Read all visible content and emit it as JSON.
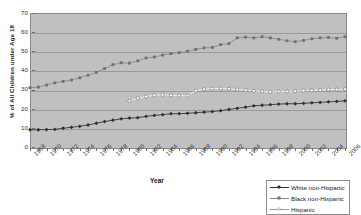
{
  "chart_data": {
    "type": "line",
    "title": "",
    "xlabel": "Year",
    "ylabel": "% of All Children under Age 18",
    "ylim": [
      0,
      70
    ],
    "ytick_values": [
      0,
      10,
      20,
      30,
      40,
      50,
      60,
      70
    ],
    "ytick_labels": [
      "0",
      "10",
      "20",
      "30",
      "40",
      "50",
      "60",
      "70"
    ],
    "xlim": [
      1968,
      2006
    ],
    "grid": true,
    "legend_position": "bottom-right",
    "x": [
      1968,
      1969,
      1970,
      1971,
      1972,
      1973,
      1974,
      1975,
      1976,
      1977,
      1978,
      1979,
      1980,
      1981,
      1982,
      1983,
      1984,
      1985,
      1986,
      1987,
      1988,
      1989,
      1990,
      1991,
      1992,
      1993,
      1994,
      1995,
      1996,
      1997,
      1998,
      1999,
      2000,
      2001,
      2002,
      2003,
      2004,
      2005,
      2006
    ],
    "xtick_labels": [
      "1968",
      "1970",
      "1972",
      "1974",
      "1976",
      "1978",
      "1980",
      "1982",
      "1984",
      "1986",
      "1988",
      "1990",
      "1992",
      "1994",
      "1996",
      "1998",
      "2000",
      "2002",
      "2004",
      "2006"
    ],
    "series": [
      {
        "name": "White non-Hispanic",
        "color": "#303030",
        "marker": "filled-diamond",
        "values": [
          9.0,
          9.0,
          9.1,
          9.2,
          9.8,
          10.3,
          10.8,
          11.5,
          12.4,
          13.3,
          14.0,
          14.7,
          15.1,
          15.3,
          16.0,
          16.5,
          16.9,
          17.4,
          17.4,
          17.6,
          17.9,
          18.2,
          18.5,
          19.0,
          19.6,
          20.2,
          20.8,
          21.5,
          21.8,
          22.1,
          22.4,
          22.6,
          22.6,
          22.8,
          23.1,
          23.3,
          23.6,
          23.8,
          24.1
        ]
      },
      {
        "name": "Black non-Hispanic",
        "color": "#707070",
        "marker": "filled-square",
        "values": [
          31.0,
          31.3,
          32.4,
          33.5,
          34.3,
          35.0,
          36.2,
          37.5,
          39.0,
          41.0,
          43.0,
          44.0,
          43.8,
          45.0,
          46.5,
          47.0,
          48.0,
          48.8,
          49.3,
          50.0,
          51.0,
          51.8,
          52.0,
          53.5,
          54.0,
          57.0,
          57.4,
          57.0,
          57.6,
          57.0,
          56.3,
          55.5,
          55.0,
          55.7,
          56.5,
          57.0,
          57.2,
          56.8,
          57.6
        ]
      },
      {
        "name": "Hispanic",
        "color": "#ffffff",
        "marker": "open-circle",
        "values": [
          null,
          null,
          null,
          null,
          null,
          null,
          null,
          null,
          null,
          null,
          null,
          null,
          24.0,
          25.5,
          26.4,
          27.0,
          27.3,
          27.0,
          26.8,
          26.8,
          29.5,
          30.2,
          30.5,
          30.6,
          30.4,
          30.0,
          29.7,
          29.3,
          29.0,
          28.8,
          29.0,
          29.0,
          29.2,
          29.4,
          29.6,
          29.8,
          30.0,
          30.0,
          30.2
        ]
      }
    ]
  },
  "legend": {
    "entries": [
      {
        "label": "White non-Hispanic"
      },
      {
        "label": "Black non-Hispanic"
      },
      {
        "label": "Hispanic"
      }
    ]
  },
  "colors": {
    "plot_background": "#c0c0c0",
    "gridline": "#9a9a9a",
    "axis": "#6f6f6f",
    "white_series": "#303030",
    "black_series": "#707070",
    "hispanic_series": "#ffffff"
  }
}
